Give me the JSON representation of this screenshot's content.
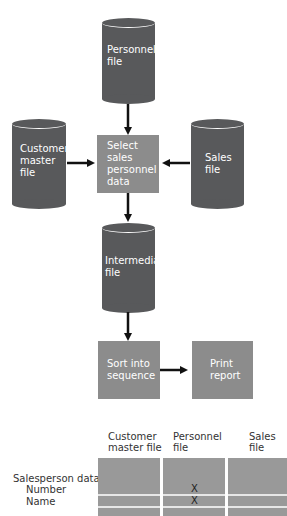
{
  "flowchart": {
    "files": {
      "personnel": "Personnel\nfile",
      "customer_master": "Customer\nmaster\nfile",
      "sales": "Sales\nfile",
      "intermediate": "Intermediate\nfile"
    },
    "processes": {
      "select": "Select\nsales\npersonnel\ndata",
      "sort": "Sort into\nsequence",
      "print": "Print\nreport"
    }
  },
  "table": {
    "columns": [
      "Customer\nmaster file",
      "Personnel\nfile",
      "Sales\nfile"
    ],
    "group_label": "Salesperson data",
    "rows": [
      {
        "label": "Number",
        "marks": [
          "",
          "X",
          ""
        ]
      },
      {
        "label": "Name",
        "marks": [
          "",
          "X",
          ""
        ]
      }
    ]
  },
  "colors": {
    "file": "#58595b",
    "process": "#8c8c8c",
    "table_cell": "#999999"
  }
}
